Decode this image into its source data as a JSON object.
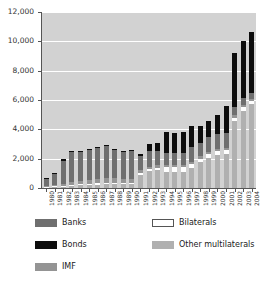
{
  "chart_data": {
    "type": "bar",
    "subtype": "stacked",
    "title": "",
    "xlabel": "",
    "ylabel": "",
    "ylim": [
      0,
      12000
    ],
    "ytick_values": [
      0,
      2000,
      4000,
      6000,
      8000,
      10000,
      12000
    ],
    "ytick_labels": [
      "0",
      "2,000",
      "4,000",
      "6,000",
      "8,000",
      "10,000",
      "12,000"
    ],
    "grid": true,
    "grid_axis": "y",
    "legend_position": "below",
    "plot_background": "#d2d2d2",
    "categories": [
      "1980",
      "1981",
      "1982",
      "1983",
      "1984",
      "1985",
      "1986",
      "1987",
      "1988",
      "1989",
      "1990",
      "1991",
      "1992",
      "1993",
      "1994",
      "1995",
      "1996",
      "1997",
      "1998",
      "1999",
      "2000",
      "2001",
      "2002",
      "2003",
      "2004"
    ],
    "series": [
      {
        "name": "Other multilaterals",
        "color": "#b0b0b0",
        "values": [
          60,
          80,
          110,
          150,
          180,
          200,
          230,
          250,
          260,
          250,
          250,
          900,
          1150,
          1250,
          1100,
          1100,
          1100,
          1350,
          1750,
          2050,
          2250,
          2350,
          4550,
          5250,
          5700
        ]
      },
      {
        "name": "Bilaterals",
        "color": "#ffffff",
        "values": [
          30,
          40,
          50,
          60,
          70,
          80,
          90,
          100,
          100,
          100,
          100,
          120,
          130,
          140,
          350,
          350,
          350,
          300,
          250,
          250,
          250,
          250,
          250,
          250,
          250
        ]
      },
      {
        "name": "IMF",
        "color": "#949494",
        "values": [
          60,
          80,
          120,
          190,
          250,
          270,
          300,
          330,
          330,
          280,
          260,
          180,
          150,
          150,
          150,
          150,
          150,
          150,
          150,
          150,
          150,
          150,
          150,
          150,
          150
        ]
      },
      {
        "name": "Banks",
        "color": "#6f6f6f",
        "values": [
          500,
          750,
          1530,
          2050,
          2000,
          2050,
          2100,
          2230,
          1900,
          1870,
          1900,
          1000,
          1070,
          960,
          800,
          800,
          800,
          1000,
          950,
          1050,
          1050,
          1000,
          600,
          500,
          400
        ]
      },
      {
        "name": "Bonds",
        "color": "#0d0d0d",
        "values": [
          50,
          50,
          190,
          50,
          50,
          50,
          50,
          50,
          50,
          50,
          50,
          100,
          500,
          600,
          1400,
          1350,
          1400,
          1400,
          1100,
          1100,
          1250,
          1850,
          3650,
          3850,
          4150
        ]
      }
    ]
  },
  "legend": {
    "items": [
      {
        "label": "Banks",
        "key": "banks"
      },
      {
        "label": "Bonds",
        "key": "bonds"
      },
      {
        "label": "IMF",
        "key": "imf"
      },
      {
        "label": "Bilaterals",
        "key": "bilaterals"
      },
      {
        "label": "Other multilaterals",
        "key": "multilaterals"
      }
    ]
  }
}
